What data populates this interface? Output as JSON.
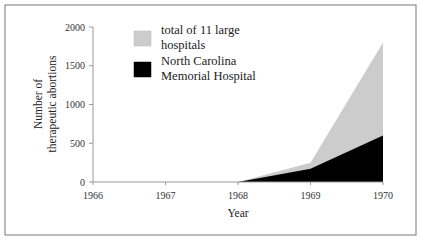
{
  "chart_data": {
    "type": "area",
    "title": "",
    "xlabel": "Year",
    "ylabel": "Number of therapeutic abortions",
    "ylabel_lines": [
      "Number of",
      "therapeutic abortions"
    ],
    "x": [
      1966,
      1967,
      1968,
      1969,
      1970
    ],
    "x_ticks": [
      "1966",
      "1967",
      "1968",
      "1969",
      "1970"
    ],
    "y_ticks": [
      "0",
      "500",
      "1000",
      "1500",
      "2000"
    ],
    "ylim": [
      0,
      2000
    ],
    "grid": false,
    "legend_position": "upper-left-inside",
    "series": [
      {
        "name": "total of 11 large hospitals",
        "legend_lines": [
          "total of 11 large",
          "hospitals"
        ],
        "color": "#cccccc",
        "values": [
          0,
          0,
          0,
          250,
          1800
        ]
      },
      {
        "name": "North Carolina Memorial Hospital",
        "legend_lines": [
          "North Carolina",
          "Memorial Hospital"
        ],
        "color": "#000000",
        "values": [
          0,
          0,
          0,
          170,
          600
        ]
      }
    ]
  }
}
